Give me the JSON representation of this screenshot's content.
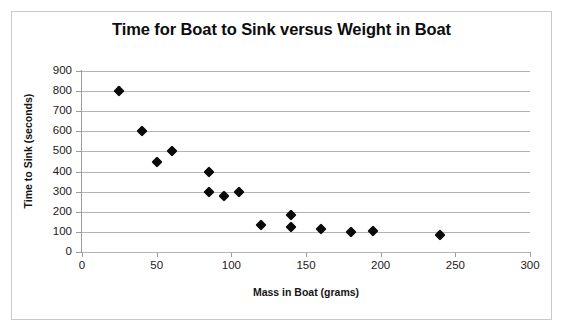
{
  "chart_data": {
    "type": "scatter",
    "title": "Time for Boat to Sink versus Weight in Boat",
    "xlabel": "Mass in Boat (grams)",
    "ylabel": "Time to Sink (seconds)",
    "xlim": [
      0,
      300
    ],
    "ylim": [
      0,
      900
    ],
    "xticks": [
      "0",
      "50",
      "100",
      "150",
      "200",
      "250",
      "300"
    ],
    "xtick_values": [
      0,
      50,
      100,
      150,
      200,
      250,
      300
    ],
    "yticks": [
      "0",
      "100",
      "200",
      "300",
      "400",
      "500",
      "600",
      "700",
      "800",
      "900"
    ],
    "ytick_values": [
      0,
      100,
      200,
      300,
      400,
      500,
      600,
      700,
      800,
      900
    ],
    "grid": "horizontal",
    "legend": "none",
    "marker": "black-diamond",
    "marker_color": "#0a0a0a",
    "series": [
      {
        "name": "Time to Sink",
        "points": [
          {
            "x": 25,
            "y": 800
          },
          {
            "x": 40,
            "y": 600
          },
          {
            "x": 50,
            "y": 450
          },
          {
            "x": 60,
            "y": 500
          },
          {
            "x": 85,
            "y": 400
          },
          {
            "x": 85,
            "y": 300
          },
          {
            "x": 95,
            "y": 280
          },
          {
            "x": 105,
            "y": 300
          },
          {
            "x": 120,
            "y": 135
          },
          {
            "x": 140,
            "y": 185
          },
          {
            "x": 140,
            "y": 125
          },
          {
            "x": 160,
            "y": 115
          },
          {
            "x": 180,
            "y": 100
          },
          {
            "x": 195,
            "y": 105
          },
          {
            "x": 240,
            "y": 85
          }
        ]
      }
    ]
  },
  "colors": {
    "marker": "#0a0a0a",
    "gridline": "#b4b4b4",
    "axis": "#9c9c9c",
    "frame_border": "#c9c9c9",
    "text": "#1a1a1a",
    "background": "#ffffff"
  }
}
